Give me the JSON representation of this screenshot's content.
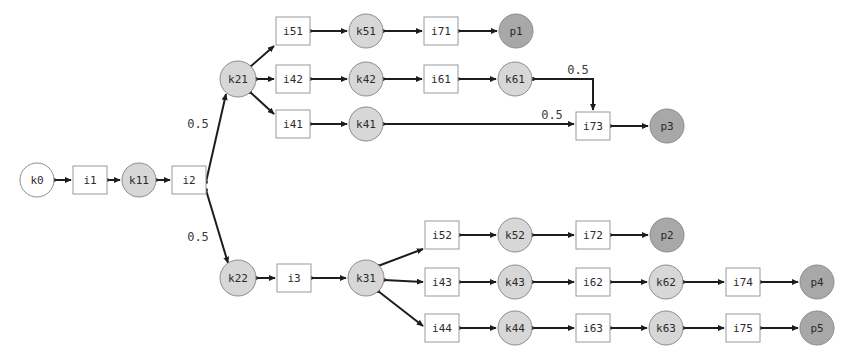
{
  "diagram": {
    "colors": {
      "background": "#ffffff",
      "place_start_fill": "#ffffff",
      "transition_fill": "#ffffff",
      "place_mid_fill": "#d7d7d7",
      "place_end_fill": "#a8a8a8",
      "node_stroke": "#8c8c8c",
      "edge_stroke": "#1d1d1d",
      "label_color": "#2b2b2b"
    },
    "nodes": [
      {
        "id": "k0",
        "label": "k0",
        "shape": "circle",
        "fill": "start",
        "cx": 37,
        "cy": 180,
        "r": 17
      },
      {
        "id": "i1",
        "label": "i1",
        "shape": "rect",
        "fill": "white",
        "x": 73,
        "y": 166,
        "w": 34,
        "h": 28
      },
      {
        "id": "k11",
        "label": "k11",
        "shape": "circle",
        "fill": "mid",
        "cx": 139,
        "cy": 180,
        "r": 17
      },
      {
        "id": "i2",
        "label": "i2",
        "shape": "rect",
        "fill": "white",
        "x": 172,
        "y": 166,
        "w": 34,
        "h": 28
      },
      {
        "id": "k21",
        "label": "k21",
        "shape": "circle",
        "fill": "mid",
        "cx": 238,
        "cy": 79,
        "r": 18
      },
      {
        "id": "i51",
        "label": "i51",
        "shape": "rect",
        "fill": "white",
        "x": 276,
        "y": 17,
        "w": 34,
        "h": 28
      },
      {
        "id": "k51",
        "label": "k51",
        "shape": "circle",
        "fill": "mid",
        "cx": 366,
        "cy": 31,
        "r": 17
      },
      {
        "id": "i71",
        "label": "i71",
        "shape": "rect",
        "fill": "white",
        "x": 424,
        "y": 17,
        "w": 34,
        "h": 28
      },
      {
        "id": "p1",
        "label": "p1",
        "shape": "circle",
        "fill": "end",
        "cx": 516,
        "cy": 31,
        "r": 17
      },
      {
        "id": "i42",
        "label": "i42",
        "shape": "rect",
        "fill": "white",
        "x": 276,
        "y": 65,
        "w": 34,
        "h": 28
      },
      {
        "id": "k42",
        "label": "k42",
        "shape": "circle",
        "fill": "mid",
        "cx": 366,
        "cy": 79,
        "r": 17
      },
      {
        "id": "i61",
        "label": "i61",
        "shape": "rect",
        "fill": "white",
        "x": 424,
        "y": 65,
        "w": 34,
        "h": 28
      },
      {
        "id": "k61",
        "label": "k61",
        "shape": "circle",
        "fill": "mid",
        "cx": 515,
        "cy": 79,
        "r": 17
      },
      {
        "id": "i41",
        "label": "i41",
        "shape": "rect",
        "fill": "white",
        "x": 276,
        "y": 110,
        "w": 34,
        "h": 28
      },
      {
        "id": "k41",
        "label": "k41",
        "shape": "circle",
        "fill": "mid",
        "cx": 366,
        "cy": 124,
        "r": 17
      },
      {
        "id": "i73",
        "label": "i73",
        "shape": "rect",
        "fill": "white",
        "x": 576,
        "y": 112,
        "w": 34,
        "h": 28
      },
      {
        "id": "p3",
        "label": "p3",
        "shape": "circle",
        "fill": "end",
        "cx": 667,
        "cy": 126,
        "r": 17
      },
      {
        "id": "k22",
        "label": "k22",
        "shape": "circle",
        "fill": "mid",
        "cx": 238,
        "cy": 278,
        "r": 18
      },
      {
        "id": "i3",
        "label": "i3",
        "shape": "rect",
        "fill": "white",
        "x": 277,
        "y": 264,
        "w": 34,
        "h": 28
      },
      {
        "id": "k31",
        "label": "k31",
        "shape": "circle",
        "fill": "mid",
        "cx": 366,
        "cy": 278,
        "r": 18
      },
      {
        "id": "i52",
        "label": "i52",
        "shape": "rect",
        "fill": "white",
        "x": 425,
        "y": 221,
        "w": 34,
        "h": 28
      },
      {
        "id": "k52",
        "label": "k52",
        "shape": "circle",
        "fill": "mid",
        "cx": 515,
        "cy": 235,
        "r": 17
      },
      {
        "id": "i72",
        "label": "i72",
        "shape": "rect",
        "fill": "white",
        "x": 576,
        "y": 221,
        "w": 34,
        "h": 28
      },
      {
        "id": "p2",
        "label": "p2",
        "shape": "circle",
        "fill": "end",
        "cx": 667,
        "cy": 235,
        "r": 17
      },
      {
        "id": "i43",
        "label": "i43",
        "shape": "rect",
        "fill": "white",
        "x": 425,
        "y": 268,
        "w": 34,
        "h": 28
      },
      {
        "id": "k43",
        "label": "k43",
        "shape": "circle",
        "fill": "mid",
        "cx": 515,
        "cy": 282,
        "r": 17
      },
      {
        "id": "i62",
        "label": "i62",
        "shape": "rect",
        "fill": "white",
        "x": 576,
        "y": 268,
        "w": 34,
        "h": 28
      },
      {
        "id": "k62",
        "label": "k62",
        "shape": "circle",
        "fill": "mid",
        "cx": 666,
        "cy": 282,
        "r": 17
      },
      {
        "id": "i74",
        "label": "i74",
        "shape": "rect",
        "fill": "white",
        "x": 726,
        "y": 268,
        "w": 34,
        "h": 28
      },
      {
        "id": "p4",
        "label": "p4",
        "shape": "circle",
        "fill": "end",
        "cx": 817,
        "cy": 282,
        "r": 17
      },
      {
        "id": "i44",
        "label": "i44",
        "shape": "rect",
        "fill": "white",
        "x": 425,
        "y": 314,
        "w": 34,
        "h": 28
      },
      {
        "id": "k44",
        "label": "k44",
        "shape": "circle",
        "fill": "mid",
        "cx": 515,
        "cy": 328,
        "r": 17
      },
      {
        "id": "i63",
        "label": "i63",
        "shape": "rect",
        "fill": "white",
        "x": 576,
        "y": 314,
        "w": 34,
        "h": 28
      },
      {
        "id": "k63",
        "label": "k63",
        "shape": "circle",
        "fill": "mid",
        "cx": 666,
        "cy": 328,
        "r": 17
      },
      {
        "id": "i75",
        "label": "i75",
        "shape": "rect",
        "fill": "white",
        "x": 726,
        "y": 314,
        "w": 34,
        "h": 28
      },
      {
        "id": "p5",
        "label": "p5",
        "shape": "circle",
        "fill": "end",
        "cx": 817,
        "cy": 328,
        "r": 17
      }
    ],
    "edges": [
      {
        "from": "k0",
        "to": "i1",
        "points": "54,180 71,180"
      },
      {
        "from": "i1",
        "to": "k11",
        "points": "107,180 120,180"
      },
      {
        "from": "k11",
        "to": "i2",
        "points": "156,180 170,180"
      },
      {
        "from": "i2",
        "to": "k21",
        "points": "206,182 226,94"
      },
      {
        "from": "i2",
        "to": "k22",
        "points": "206,190 228,263"
      },
      {
        "from": "k21",
        "to": "i51",
        "points": "250,67 274,46"
      },
      {
        "from": "i51",
        "to": "k51",
        "points": "310,31 347,31"
      },
      {
        "from": "k51",
        "to": "i71",
        "points": "383,31 422,31"
      },
      {
        "from": "i71",
        "to": "p1",
        "points": "458,31 497,31"
      },
      {
        "from": "k21",
        "to": "i42",
        "points": "256,79 274,79"
      },
      {
        "from": "i42",
        "to": "k42",
        "points": "310,79 347,79"
      },
      {
        "from": "k42",
        "to": "i61",
        "points": "383,79 422,79"
      },
      {
        "from": "i61",
        "to": "k61",
        "points": "458,79 496,79"
      },
      {
        "from": "k21",
        "to": "i41",
        "points": "250,92 274,114"
      },
      {
        "from": "i41",
        "to": "k41",
        "points": "310,124 347,124"
      },
      {
        "from": "k41",
        "to": "i73",
        "points": "383,124 574,124",
        "label": "0.5",
        "label_x": 552,
        "label_y": 115
      },
      {
        "from": "k61",
        "to": "i73",
        "points": "533,79 593,79 593,110",
        "label": "0.5",
        "label_x": 578,
        "label_y": 70
      },
      {
        "from": "i73",
        "to": "p3",
        "points": "610,126 648,126"
      },
      {
        "from": "k22",
        "to": "i3",
        "points": "256,278 275,278"
      },
      {
        "from": "i3",
        "to": "k31",
        "points": "311,278 346,278"
      },
      {
        "from": "k31",
        "to": "i52",
        "points": "378,266 423,249"
      },
      {
        "from": "i52",
        "to": "k52",
        "points": "459,235 496,235"
      },
      {
        "from": "k52",
        "to": "i72",
        "points": "532,235 574,235"
      },
      {
        "from": "i72",
        "to": "p2",
        "points": "610,235 648,235"
      },
      {
        "from": "k31",
        "to": "i43",
        "points": "384,280 423,282"
      },
      {
        "from": "i43",
        "to": "k43",
        "points": "459,282 496,282"
      },
      {
        "from": "k43",
        "to": "i62",
        "points": "532,282 574,282"
      },
      {
        "from": "i62",
        "to": "k62",
        "points": "610,282 647,282"
      },
      {
        "from": "k62",
        "to": "i74",
        "points": "683,282 724,282"
      },
      {
        "from": "i74",
        "to": "p4",
        "points": "760,282 798,282"
      },
      {
        "from": "k31",
        "to": "i44",
        "points": "378,291 423,326"
      },
      {
        "from": "i44",
        "to": "k44",
        "points": "459,328 496,328"
      },
      {
        "from": "k44",
        "to": "i63",
        "points": "532,328 574,328"
      },
      {
        "from": "i63",
        "to": "k63",
        "points": "610,328 647,328"
      },
      {
        "from": "k63",
        "to": "i75",
        "points": "683,328 724,328"
      },
      {
        "from": "i75",
        "to": "p5",
        "points": "760,328 798,328"
      }
    ],
    "edge_labels": [
      {
        "text": "0.5",
        "x": 198,
        "y": 124
      },
      {
        "text": "0.5",
        "x": 198,
        "y": 237
      },
      {
        "text": "0.5",
        "x": 578,
        "y": 70
      },
      {
        "text": "0.5",
        "x": 552,
        "y": 115
      }
    ]
  }
}
